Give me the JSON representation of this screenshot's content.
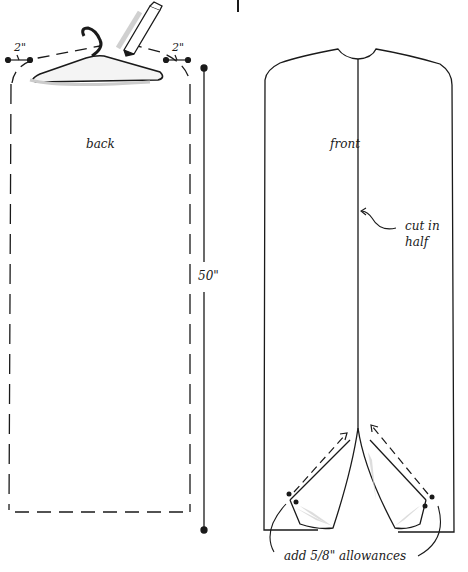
{
  "figure": {
    "left_panel": {
      "label": "back",
      "width_allowance_left": "2\"",
      "width_allowance_right": "2\"",
      "length_dimension": "50\""
    },
    "right_panel": {
      "label": "front",
      "center_note_line1": "cut in",
      "center_note_line2": "half",
      "bottom_note": "add 5/8\" allowances"
    }
  },
  "colors": {
    "ink": "#1a1a1a",
    "shade": "#bdbdbd",
    "paper": "#ffffff"
  }
}
